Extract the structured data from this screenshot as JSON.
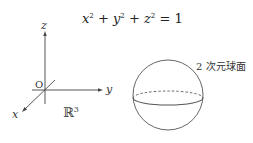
{
  "equation": {
    "text": "x² + y² + z² = 1",
    "x": "x",
    "y": "y",
    "z": "z",
    "exp": "2",
    "rhs": "= 1"
  },
  "axes": {
    "z_label": "z",
    "y_label": "y",
    "x_label": "x",
    "origin_label": "O",
    "space_label": "ℝ",
    "space_exp": "3"
  },
  "sphere": {
    "label": "2 次元球面"
  }
}
